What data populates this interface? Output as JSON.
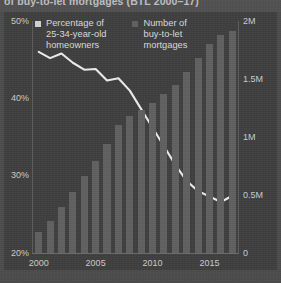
{
  "title": "of buy-to-let mortgages (BTL 2000–17)",
  "colors": {
    "panel_background": "#3d3d3d",
    "page_background": "#4a4a4a",
    "bar": "#5e5e5e",
    "line": "#e8e8e8",
    "axis_text": "#c9c9c9",
    "legend_text": "#d8d8d8"
  },
  "legend": {
    "items": [
      {
        "label": "Percentage of\n25-34-year-old\nhomeowners",
        "marker": "square-swatch",
        "color": "#cfcfcf"
      },
      {
        "label": "Number of\nbuy-to-let\nmortgages",
        "marker": "square-swatch",
        "color": "#5e5e5e"
      }
    ]
  },
  "axes": {
    "left_ticks": [
      "50%",
      "40%",
      "30%",
      "20%"
    ],
    "right_ticks": [
      "2M",
      "1.5M",
      "1M",
      "0.5M",
      "0"
    ],
    "bottom_ticks": [
      "2000",
      "2005",
      "2010",
      "2015"
    ]
  },
  "chart_data": {
    "type": "bar",
    "title": "of buy-to-let mortgages (BTL 2000–17)",
    "xlabel": "",
    "grid": false,
    "legend_position": "top-left",
    "categories": [
      "2000",
      "2001",
      "2002",
      "2003",
      "2004",
      "2005",
      "2006",
      "2007",
      "2008",
      "2009",
      "2010",
      "2011",
      "2012",
      "2013",
      "2014",
      "2015",
      "2016",
      "2017"
    ],
    "series": [
      {
        "name": "Number of buy-to-let mortgages",
        "chart_type": "bar",
        "axis": "right",
        "ylabel": "Number of buy-to-let mortgages",
        "ylim": [
          0,
          2000000
        ],
        "ytick_labels": [
          "0",
          "0.5M",
          "1M",
          "1.5M",
          "2M"
        ],
        "values": [
          180000,
          275000,
          400000,
          530000,
          660000,
          790000,
          940000,
          1100000,
          1180000,
          1230000,
          1290000,
          1370000,
          1450000,
          1560000,
          1680000,
          1800000,
          1880000,
          1910000
        ]
      },
      {
        "name": "Percentage of 25-34-year-old homeowners",
        "chart_type": "line",
        "axis": "left",
        "ylabel": "Percentage of 25-34-year-old homeowners",
        "ylim": [
          20,
          50
        ],
        "ytick_labels": [
          "20%",
          "30%",
          "40%",
          "50%"
        ],
        "values": [
          46.0,
          45.2,
          45.8,
          44.6,
          43.7,
          43.8,
          42.3,
          42.6,
          41.0,
          38.6,
          36.2,
          33.8,
          31.4,
          29.3,
          28.0,
          27.3,
          26.6,
          27.4
        ]
      }
    ]
  }
}
